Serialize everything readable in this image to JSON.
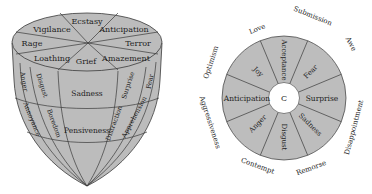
{
  "cone_model": {
    "top_face": {
      "segments": [
        "Ecstasy",
        "Anticipation",
        "Terror",
        "Amazement",
        "Grief",
        "Loathing",
        "Rage",
        "Vigilance"
      ]
    },
    "body": {
      "upper_band": [
        "Anger",
        "Disgust",
        "Sadness",
        "Surprise",
        "Fear"
      ],
      "lower_band": [
        "Annoyance",
        "Boredom",
        "Pensiveness",
        "Distraction",
        "Apprehension"
      ]
    }
  },
  "wheel_model": {
    "center_label": "C",
    "inner_segments": [
      "Acceptance",
      "Fear",
      "Surprise",
      "Sadness",
      "Disgust",
      "Anger",
      "Anticipation",
      "Joy"
    ],
    "outer_labels": [
      "Submission",
      "Awe",
      "Disappointment",
      "Remorse",
      "Contempt",
      "Aggressiveness",
      "Optimism",
      "Love"
    ]
  }
}
